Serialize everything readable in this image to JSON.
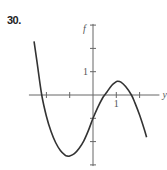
{
  "problem": {
    "number": "30."
  },
  "chart_data": {
    "type": "line",
    "title": "",
    "xlabel": "y",
    "ylabel": "f",
    "xlim": [
      -2.75,
      2.85
    ],
    "ylim": [
      -3.05,
      3.05
    ],
    "grid": false,
    "x_ticks": [
      -2,
      -1,
      1,
      2
    ],
    "y_ticks": [
      -3,
      -2,
      -1,
      1,
      2,
      3
    ],
    "x_tick_labels": [
      {
        "value": 1,
        "label": "1"
      }
    ],
    "y_tick_labels": [
      {
        "value": 1,
        "label": "1"
      }
    ],
    "series": [
      {
        "name": "f",
        "description": "cubic with roots near y=-2.2, 0.5, 1.65; local min ~(-1.1,-2.6); local max ~(1.05,0.6); f(0)=-1",
        "x": [
          -2.53,
          -2.4,
          -2.2,
          -2.0,
          -1.8,
          -1.6,
          -1.4,
          -1.2,
          -1.1,
          -1.0,
          -0.8,
          -0.6,
          -0.4,
          -0.2,
          0.0,
          0.2,
          0.4,
          0.5,
          0.6,
          0.8,
          1.0,
          1.05,
          1.2,
          1.4,
          1.65,
          1.8,
          2.0,
          2.2,
          2.3
        ],
        "y": [
          2.3,
          1.4,
          0.0,
          -0.91,
          -1.57,
          -2.05,
          -2.38,
          -2.58,
          -2.62,
          -2.62,
          -2.52,
          -2.3,
          -1.98,
          -1.53,
          -1.0,
          -0.54,
          -0.15,
          0.0,
          0.13,
          0.41,
          0.57,
          0.59,
          0.55,
          0.36,
          0.0,
          -0.34,
          -0.86,
          -1.47,
          -1.81
        ]
      }
    ]
  }
}
